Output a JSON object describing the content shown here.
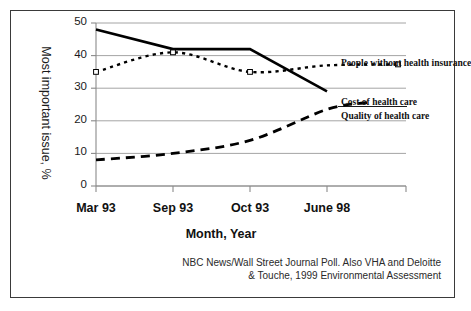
{
  "figure": {
    "border_color": "#3a3a3a",
    "background": "#ffffff"
  },
  "chart_data": {
    "type": "line",
    "title": "",
    "xlabel": "Month, Year",
    "ylabel": "Most important issue, %",
    "categories": [
      "Mar 93",
      "Sep 93",
      "Oct 93",
      "June 98"
    ],
    "yticks": [
      "0",
      "10",
      "20",
      "30",
      "40",
      "50"
    ],
    "ylim": [
      0,
      50
    ],
    "grid": true,
    "legend_position": "inline-right",
    "series": [
      {
        "name": "Cost of health care",
        "values": [
          48,
          42,
          42,
          29
        ],
        "style": "solid",
        "color": "#000000",
        "marker": "none"
      },
      {
        "name": "People without health insurance",
        "values": [
          35,
          41,
          35,
          37
        ],
        "style": "dotted",
        "color": "#000000",
        "marker": "open-square"
      },
      {
        "name": "Quality of health care",
        "values": [
          8,
          10,
          14,
          23.5
        ],
        "style": "dashed",
        "color": "#000000",
        "marker": "none"
      }
    ],
    "annotations": [
      "NBC News/Wall Street Journal Poll. Also VHA and Deloitte",
      "& Touche, 1999 Environmental Assessment"
    ]
  },
  "source": {
    "line1": "NBC News/Wall Street Journal Poll. Also VHA and Deloitte",
    "line2": "& Touche, 1999 Environmental Assessment"
  }
}
